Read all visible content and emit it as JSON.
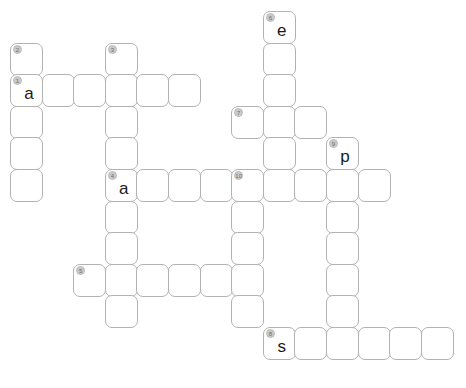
{
  "puzzle": {
    "title": "Crossword Grid",
    "columns": 14,
    "rows": 12,
    "cell_size_px": 33,
    "cell_pitch_px": 31.6,
    "origin_x_px": 10,
    "origin_y_px": 11,
    "colors": {
      "background": "#ffffff",
      "cell_fill": "#ffffff",
      "cell_border": "#b2b2b2",
      "badge_fill": "#c9c9c9",
      "badge_text": "#6e6e6e",
      "letter_text": "#1a1a1a"
    },
    "filled_letters": [
      "a",
      "e",
      "a",
      "p",
      "s"
    ],
    "cells": [
      {
        "name": "cell-r0c8",
        "col": 8,
        "row": 0,
        "number": "6",
        "letter": "e"
      },
      {
        "name": "cell-r1c0",
        "col": 0,
        "row": 1,
        "number": "2",
        "letter": ""
      },
      {
        "name": "cell-r1c3",
        "col": 3,
        "row": 1,
        "number": "3",
        "letter": ""
      },
      {
        "name": "cell-r1c8",
        "col": 8,
        "row": 1,
        "number": "",
        "letter": ""
      },
      {
        "name": "cell-r2c0",
        "col": 0,
        "row": 2,
        "number": "1",
        "letter": "a"
      },
      {
        "name": "cell-r2c1",
        "col": 1,
        "row": 2,
        "number": "",
        "letter": ""
      },
      {
        "name": "cell-r2c2",
        "col": 2,
        "row": 2,
        "number": "",
        "letter": ""
      },
      {
        "name": "cell-r2c3",
        "col": 3,
        "row": 2,
        "number": "",
        "letter": ""
      },
      {
        "name": "cell-r2c4",
        "col": 4,
        "row": 2,
        "number": "",
        "letter": ""
      },
      {
        "name": "cell-r2c5",
        "col": 5,
        "row": 2,
        "number": "",
        "letter": ""
      },
      {
        "name": "cell-r2c8",
        "col": 8,
        "row": 2,
        "number": "",
        "letter": ""
      },
      {
        "name": "cell-r3c0",
        "col": 0,
        "row": 3,
        "number": "",
        "letter": ""
      },
      {
        "name": "cell-r3c3",
        "col": 3,
        "row": 3,
        "number": "",
        "letter": ""
      },
      {
        "name": "cell-r3c7",
        "col": 7,
        "row": 3,
        "number": "7",
        "letter": ""
      },
      {
        "name": "cell-r3c8",
        "col": 8,
        "row": 3,
        "number": "",
        "letter": ""
      },
      {
        "name": "cell-r3c9",
        "col": 9,
        "row": 3,
        "number": "",
        "letter": ""
      },
      {
        "name": "cell-r4c0",
        "col": 0,
        "row": 4,
        "number": "",
        "letter": ""
      },
      {
        "name": "cell-r4c3",
        "col": 3,
        "row": 4,
        "number": "",
        "letter": ""
      },
      {
        "name": "cell-r4c8",
        "col": 8,
        "row": 4,
        "number": "",
        "letter": ""
      },
      {
        "name": "cell-r4c10",
        "col": 10,
        "row": 4,
        "number": "9",
        "letter": "p"
      },
      {
        "name": "cell-r5c0",
        "col": 0,
        "row": 5,
        "number": "",
        "letter": ""
      },
      {
        "name": "cell-r5c3",
        "col": 3,
        "row": 5,
        "number": "4",
        "letter": "a"
      },
      {
        "name": "cell-r5c4",
        "col": 4,
        "row": 5,
        "number": "",
        "letter": ""
      },
      {
        "name": "cell-r5c5",
        "col": 5,
        "row": 5,
        "number": "",
        "letter": ""
      },
      {
        "name": "cell-r5c6",
        "col": 6,
        "row": 5,
        "number": "",
        "letter": ""
      },
      {
        "name": "cell-r5c7",
        "col": 7,
        "row": 5,
        "number": "10",
        "letter": ""
      },
      {
        "name": "cell-r5c8",
        "col": 8,
        "row": 5,
        "number": "",
        "letter": ""
      },
      {
        "name": "cell-r5c9",
        "col": 9,
        "row": 5,
        "number": "",
        "letter": ""
      },
      {
        "name": "cell-r5c10",
        "col": 10,
        "row": 5,
        "number": "",
        "letter": ""
      },
      {
        "name": "cell-r5c11",
        "col": 11,
        "row": 5,
        "number": "",
        "letter": ""
      },
      {
        "name": "cell-r6c3",
        "col": 3,
        "row": 6,
        "number": "",
        "letter": ""
      },
      {
        "name": "cell-r6c7",
        "col": 7,
        "row": 6,
        "number": "",
        "letter": ""
      },
      {
        "name": "cell-r6c10",
        "col": 10,
        "row": 6,
        "number": "",
        "letter": ""
      },
      {
        "name": "cell-r7c3",
        "col": 3,
        "row": 7,
        "number": "",
        "letter": ""
      },
      {
        "name": "cell-r7c7",
        "col": 7,
        "row": 7,
        "number": "",
        "letter": ""
      },
      {
        "name": "cell-r7c10",
        "col": 10,
        "row": 7,
        "number": "",
        "letter": ""
      },
      {
        "name": "cell-r8c2",
        "col": 2,
        "row": 8,
        "number": "5",
        "letter": ""
      },
      {
        "name": "cell-r8c3",
        "col": 3,
        "row": 8,
        "number": "",
        "letter": ""
      },
      {
        "name": "cell-r8c4",
        "col": 4,
        "row": 8,
        "number": "",
        "letter": ""
      },
      {
        "name": "cell-r8c5",
        "col": 5,
        "row": 8,
        "number": "",
        "letter": ""
      },
      {
        "name": "cell-r8c6",
        "col": 6,
        "row": 8,
        "number": "",
        "letter": ""
      },
      {
        "name": "cell-r8c7",
        "col": 7,
        "row": 8,
        "number": "",
        "letter": ""
      },
      {
        "name": "cell-r8c10",
        "col": 10,
        "row": 8,
        "number": "",
        "letter": ""
      },
      {
        "name": "cell-r9c3",
        "col": 3,
        "row": 9,
        "number": "",
        "letter": ""
      },
      {
        "name": "cell-r9c7",
        "col": 7,
        "row": 9,
        "number": "",
        "letter": ""
      },
      {
        "name": "cell-r9c10",
        "col": 10,
        "row": 9,
        "number": "",
        "letter": ""
      },
      {
        "name": "cell-r10c8",
        "col": 8,
        "row": 10,
        "number": "8",
        "letter": "s"
      },
      {
        "name": "cell-r10c9",
        "col": 9,
        "row": 10,
        "number": "",
        "letter": ""
      },
      {
        "name": "cell-r10c10",
        "col": 10,
        "row": 10,
        "number": "",
        "letter": ""
      },
      {
        "name": "cell-r10c11",
        "col": 11,
        "row": 10,
        "number": "",
        "letter": ""
      },
      {
        "name": "cell-r10c12",
        "col": 12,
        "row": 10,
        "number": "",
        "letter": ""
      },
      {
        "name": "cell-r10c13",
        "col": 13,
        "row": 10,
        "number": "",
        "letter": ""
      }
    ]
  }
}
